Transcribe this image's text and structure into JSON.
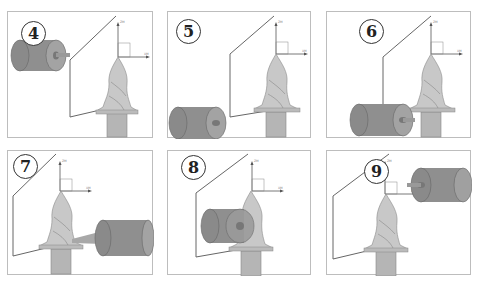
{
  "figure": {
    "panels": [
      {
        "step": "4",
        "wheel_position": "upper-left, detached"
      },
      {
        "step": "5",
        "wheel_position": "lower-left, approaching base"
      },
      {
        "step": "6",
        "wheel_position": "left, contacting base flange"
      },
      {
        "step": "7",
        "wheel_position": "right, contacting base flange"
      },
      {
        "step": "8",
        "wheel_position": "center, grinding flute"
      },
      {
        "step": "9",
        "wheel_position": "upper-right, retracted"
      }
    ],
    "axis_labels": {
      "z": "ZM",
      "x": "XM"
    },
    "colors": {
      "wheel": "#8a8a8a",
      "wheel_face": "#a0a0a0",
      "workpiece": "#c4c4c4",
      "workpiece_shank": "#b5b5b5",
      "frame_border": "#bdbdbd",
      "wire": "#666666"
    }
  }
}
